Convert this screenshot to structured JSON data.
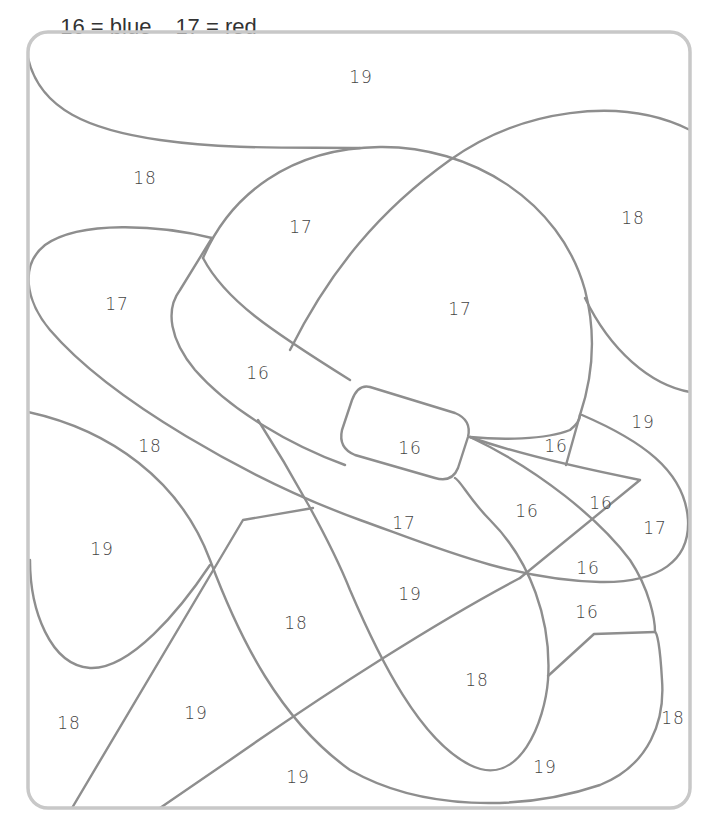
{
  "legend": [
    {
      "number": "16",
      "color_name": "blue",
      "text": "16 = blue"
    },
    {
      "number": "17",
      "color_name": "red",
      "text": "17 = red"
    }
  ],
  "colors": {
    "line": "#8e8e8e",
    "frame": "#c8c8c8",
    "text": "#444444"
  },
  "regions": [
    {
      "label": "19",
      "x": 361,
      "y": 77
    },
    {
      "label": "18",
      "x": 145,
      "y": 178
    },
    {
      "label": "17",
      "x": 301,
      "y": 227
    },
    {
      "label": "18",
      "x": 633,
      "y": 218
    },
    {
      "label": "17",
      "x": 117,
      "y": 304
    },
    {
      "label": "17",
      "x": 460,
      "y": 309
    },
    {
      "label": "16",
      "x": 258,
      "y": 373
    },
    {
      "label": "19",
      "x": 643,
      "y": 422
    },
    {
      "label": "18",
      "x": 150,
      "y": 446
    },
    {
      "label": "16",
      "x": 410,
      "y": 448
    },
    {
      "label": "16",
      "x": 556,
      "y": 446
    },
    {
      "label": "16",
      "x": 527,
      "y": 511
    },
    {
      "label": "16",
      "x": 601,
      "y": 503
    },
    {
      "label": "17",
      "x": 404,
      "y": 523
    },
    {
      "label": "17",
      "x": 655,
      "y": 528
    },
    {
      "label": "19",
      "x": 102,
      "y": 549
    },
    {
      "label": "16",
      "x": 588,
      "y": 568
    },
    {
      "label": "19",
      "x": 410,
      "y": 594
    },
    {
      "label": "16",
      "x": 587,
      "y": 612
    },
    {
      "label": "18",
      "x": 296,
      "y": 623
    },
    {
      "label": "18",
      "x": 477,
      "y": 680
    },
    {
      "label": "18",
      "x": 673,
      "y": 718
    },
    {
      "label": "19",
      "x": 196,
      "y": 713
    },
    {
      "label": "18",
      "x": 69,
      "y": 723
    },
    {
      "label": "19",
      "x": 545,
      "y": 767
    },
    {
      "label": "19",
      "x": 298,
      "y": 777
    }
  ]
}
